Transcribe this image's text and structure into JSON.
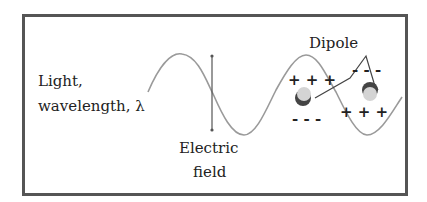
{
  "diagram": {
    "labels": {
      "light_line1": "Light,",
      "light_line2": "wavelength, λ",
      "field_line1": "Electric",
      "field_line2": "field",
      "dipole": "Dipole"
    },
    "charges": {
      "left_top": "+ + +",
      "left_bottom": "- - -",
      "right_top": "- - -",
      "right_bottom": "+ + +"
    },
    "colors": {
      "frame": "#555555",
      "wave": "#9a9a9a",
      "arrow": "#555555",
      "text": "#222222",
      "atom_fill": "#d4d4d4",
      "atom_shadow": "#444444"
    }
  }
}
